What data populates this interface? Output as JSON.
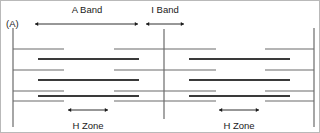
{
  "figure": {
    "panel_label": "(A)",
    "title_labels": {
      "a_band": "A Band",
      "i_band": "I Band",
      "h_zone_left": "H Zone",
      "h_zone_right": "H Zone"
    },
    "colors": {
      "thin_filament": "#6b6b6b",
      "thick_filament": "#3a3a3a",
      "z_line": "#6b6b6b",
      "m_line": "#6b6b6b",
      "arrow": "#1a1a1a",
      "text": "#1a1a1a",
      "background": "#ffffff",
      "border": "#b9b9b9"
    }
  },
  "chart_data": {
    "type": "diagram",
    "width": 320,
    "height": 133,
    "vertical_lines": [
      {
        "name": "z-line-left",
        "x": 12,
        "y1": 27,
        "y2": 126,
        "kind": "z-line"
      },
      {
        "name": "z-line-center",
        "x": 163,
        "y1": 28,
        "y2": 118,
        "kind": "z-line"
      },
      {
        "name": "z-line-right",
        "x": 313,
        "y1": 27,
        "y2": 126,
        "kind": "z-line"
      }
    ],
    "thin_filaments": [
      {
        "name": "thin-1-left",
        "x1": 12,
        "x2": 63,
        "y": 48
      },
      {
        "name": "thin-1-midL",
        "x1": 113,
        "x2": 163,
        "y": 48
      },
      {
        "name": "thin-1-midR",
        "x1": 163,
        "x2": 215,
        "y": 48
      },
      {
        "name": "thin-1-right",
        "x1": 264,
        "x2": 313,
        "y": 48
      },
      {
        "name": "thin-2-left",
        "x1": 12,
        "x2": 63,
        "y": 69
      },
      {
        "name": "thin-2-midL",
        "x1": 113,
        "x2": 163,
        "y": 69
      },
      {
        "name": "thin-2-midR",
        "x1": 163,
        "x2": 215,
        "y": 69
      },
      {
        "name": "thin-2-right",
        "x1": 264,
        "x2": 313,
        "y": 69
      },
      {
        "name": "thin-3-left",
        "x1": 12,
        "x2": 63,
        "y": 90
      },
      {
        "name": "thin-3-midL",
        "x1": 113,
        "x2": 163,
        "y": 90
      },
      {
        "name": "thin-3-midR",
        "x1": 163,
        "x2": 215,
        "y": 90
      },
      {
        "name": "thin-3-right",
        "x1": 264,
        "x2": 313,
        "y": 90
      },
      {
        "name": "thin-4-left",
        "x1": 12,
        "x2": 63,
        "y": 100
      },
      {
        "name": "thin-4-midL",
        "x1": 113,
        "x2": 163,
        "y": 100
      },
      {
        "name": "thin-4-midR",
        "x1": 163,
        "x2": 215,
        "y": 100
      },
      {
        "name": "thin-4-right",
        "x1": 264,
        "x2": 313,
        "y": 100
      }
    ],
    "thick_filaments": [
      {
        "name": "thick-1-left",
        "x1": 37,
        "x2": 138,
        "y": 58
      },
      {
        "name": "thick-1-right",
        "x1": 188,
        "x2": 289,
        "y": 58
      },
      {
        "name": "thick-2-left",
        "x1": 37,
        "x2": 138,
        "y": 79
      },
      {
        "name": "thick-2-right",
        "x1": 188,
        "x2": 289,
        "y": 79
      },
      {
        "name": "thick-3-left",
        "x1": 37,
        "x2": 138,
        "y": 95
      },
      {
        "name": "thick-3-right",
        "x1": 188,
        "x2": 289,
        "y": 95
      }
    ],
    "measure_arrows": [
      {
        "name": "a-band-arrow",
        "x1": 34,
        "x2": 137,
        "y": 23,
        "label": "A Band",
        "label_x": 86,
        "label_y": 12
      },
      {
        "name": "i-band-arrow",
        "x1": 145,
        "x2": 183,
        "y": 23,
        "label": "I Band",
        "label_x": 164,
        "label_y": 12
      },
      {
        "name": "h-zone-left-arrow",
        "x1": 67,
        "x2": 107,
        "y": 109,
        "label": "H Zone",
        "label_x": 87,
        "label_y": 128
      },
      {
        "name": "h-zone-right-arrow",
        "x1": 218,
        "x2": 258,
        "y": 109,
        "label": "H Zone",
        "label_x": 238,
        "label_y": 128
      }
    ],
    "panel_label": {
      "text": "(A)",
      "x": 5,
      "y": 26
    }
  }
}
